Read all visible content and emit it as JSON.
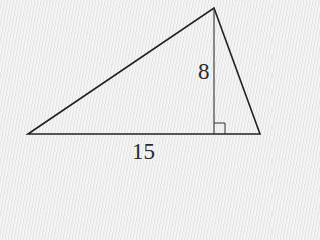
{
  "figure": {
    "type": "triangle-with-altitude",
    "vertices": {
      "left": [
        28,
        134
      ],
      "top": [
        214,
        8
      ],
      "right": [
        260,
        134
      ]
    },
    "altitude_foot": [
      214,
      134
    ],
    "right_angle_marker_size": 11,
    "stroke_color": "#222222",
    "background_color": "#ececec"
  },
  "labels": {
    "height": "8",
    "base": "15"
  }
}
